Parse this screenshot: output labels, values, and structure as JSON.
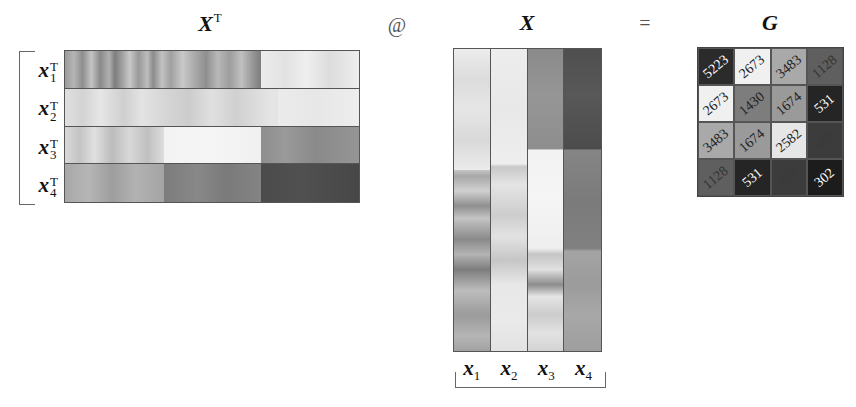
{
  "titles": {
    "xt": "X",
    "xt_sup": "T",
    "op_matmul": "@",
    "x": "X",
    "op_eq": "=",
    "g": "G"
  },
  "xt_rows": [
    {
      "label": "x",
      "sub": "1",
      "sup": "T",
      "background": "linear-gradient(to right, #9a9a9a 0%, #b5b5b5 3%, #8e8e8e 6%, #c4c4c4 9%, #8a8a8a 12%, #b0b0b0 15%, #7e7e7e 17%, #a8a8a8 20%, #c8c8c8 22%, #999 25%, #bdbdbd 28%, #8b8b8b 30%, #c2c2c2 33%, #a0a0a0 36%, #c9c9c9 40%, #ababab 44%, #8f8f8f 48%, #b8b8b8 52%, #9d9d9d 56%, #c0c0c0 60%, #959595 64%, #7f7f7f 66.5%, #ececec 66.6%, #e2e2e2 75%, #efefef 82%, #dcdcdc 90%, #eeeeee 100%)"
    },
    {
      "label": "x",
      "sub": "2",
      "sup": "T",
      "background": "linear-gradient(to right, #e0e0e0 0%, #d3d3d3 6%, #e6e6e6 12%, #cfcfcf 20%, #e3e3e3 26%, #d6d6d6 34%, #cccccc 42%, #e0e0e0 50%, #d0d0d0 58%, #dadada 64%, #e5e5e5 70%, #e4e4e4 72.5%, #ebebeb 72.6%, #e7e7e7 85%, #ededed 100%)"
    },
    {
      "label": "x",
      "sub": "3",
      "sup": "T",
      "background": "linear-gradient(to right, #d8d8d8 0%, #c4c4c4 5%, #e0e0e0 10%, #bcbcbc 16%, #d8d8d8 22%, #c0c0c0 28%, #dcdcdc 33.5%, #f3f3f3 33.6%, #f5f5f5 50%, #f0f0f0 66.5%, #8e8e8e 66.6%, #9a9a9a 75%, #8a8a8a 85%, #959595 100%)"
    },
    {
      "label": "x",
      "sub": "4",
      "sup": "T",
      "background": "linear-gradient(to right, #a8a8a8 0%, #b6b6b6 8%, #9e9e9e 16%, #b2b2b2 24%, #a4a4a4 33.5%, #7c7c7c 33.6%, #888888 45%, #7a7a7a 55%, #848484 66.5%, #4b4b4b 66.6%, #505050 80%, #474747 100%)"
    }
  ],
  "x_cols": [
    {
      "label": "x",
      "sub": "1",
      "background": "linear-gradient(to bottom, #ececec 0%, #dcdcdc 10%, #e6e6e6 20%, #d9d9d9 30%, #ebebeb 40%, #e3e3e3 33%, #9e9e9e 33.5%, #c8c8c8 37%, #a7a7a7 42%, #d0d0d0 47%, #8f8f8f 52%, #c4c4c4 56%, #8a8a8a 63%, #b4b4b4 68%, #7d7d7d 73%, #bdbdbd 80%, #9b9b9b 88%, #b5b5b5 95%, #a2a2a2 100%)"
    },
    {
      "label": "x",
      "sub": "2",
      "background": "linear-gradient(to bottom, #ededed 0%, #e8e8e8 20%, #eeeeee 38%, #c8c8c8 39%, #e4e4e4 45%, #cdcdcd 55%, #e2e2e2 62%, #c6c6c6 70%, #e8e8e8 78%, #eaeaea 90%, #e2e2e2 100%)"
    },
    {
      "label": "x",
      "sub": "3",
      "background": "linear-gradient(to bottom, #8a8a8a 0%, #969696 15%, #8e8e8e 33%, #f2f2f2 33.5%, #f5f5f5 50%, #eeeeee 66%, #c5c5c5 68%, #e0e0e0 73%, #8c8c8c 78%, #e5e5e5 82%, #cccccc 88%, #e2e2e2 94%, #d4d4d4 100%)"
    },
    {
      "label": "x",
      "sub": "4",
      "background": "linear-gradient(to bottom, #4f4f4f 0%, #585858 15%, #4c4c4c 33%, #858585 33.5%, #7b7b7b 50%, #808080 66%, #a4a4a4 67%, #9b9b9b 78%, #a8a8a8 88%, #9e9e9e 100%)"
    }
  ],
  "chart_data": {
    "type": "heatmap",
    "title": "G",
    "rows": [
      "x1",
      "x2",
      "x3",
      "x4"
    ],
    "cols": [
      "x1",
      "x2",
      "x3",
      "x4"
    ],
    "values": [
      [
        5223,
        2673,
        3483,
        1128
      ],
      [
        2673,
        1430,
        1674,
        531
      ],
      [
        3483,
        1674,
        2582,
        869
      ],
      [
        1128,
        531,
        869,
        302
      ]
    ]
  },
  "g_cells": [
    {
      "value": "5223",
      "bg": "#2b2b2b",
      "fg": "#ffffff"
    },
    {
      "value": "2673",
      "bg": "#f0f0f0",
      "fg": "#222222"
    },
    {
      "value": "3483",
      "bg": "#a9a9a9",
      "fg": "#222222"
    },
    {
      "value": "1128",
      "bg": "#5f5f5f",
      "fg": "#333333"
    },
    {
      "value": "2673",
      "bg": "#f0f0f0",
      "fg": "#222222"
    },
    {
      "value": "1430",
      "bg": "#7d7d7d",
      "fg": "#222222"
    },
    {
      "value": "1674",
      "bg": "#9a9a9a",
      "fg": "#222222"
    },
    {
      "value": "531",
      "bg": "#252525",
      "fg": "#ffffff"
    },
    {
      "value": "3483",
      "bg": "#a9a9a9",
      "fg": "#222222"
    },
    {
      "value": "1674",
      "bg": "#9a9a9a",
      "fg": "#222222"
    },
    {
      "value": "2582",
      "bg": "#e6e6e6",
      "fg": "#222222"
    },
    {
      "value": "869",
      "bg": "#3c3c3c",
      "fg": "#3a3a3a"
    },
    {
      "value": "1128",
      "bg": "#5f5f5f",
      "fg": "#333333"
    },
    {
      "value": "531",
      "bg": "#252525",
      "fg": "#ffffff"
    },
    {
      "value": "869",
      "bg": "#3c3c3c",
      "fg": "#3a3a3a"
    },
    {
      "value": "302",
      "bg": "#1c1c1c",
      "fg": "#ffffff"
    }
  ]
}
